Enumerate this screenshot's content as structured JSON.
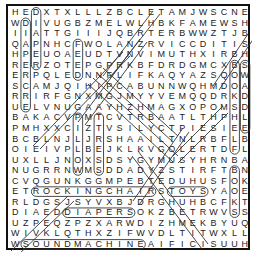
{
  "puzzle": {
    "rows": 23,
    "cols": 23,
    "grid": [
      "HEDXTXLLLZBCLETAMJWSCNE",
      "WDIVUGBZMELWLHBKFAMEWSH",
      "IIATTGIIIJQBRTERBWWZTJB",
      "QAPNHCFWOLANZRVICCDITIS",
      "HPEUOAEUDTVNVIMUTHXIRBH",
      "RERZOTEPGPRKBFDRDGMCXBS",
      "ERPQLEDNNFLIFKAQYAZSQOW",
      "SCAMJQIHIPCABUNNWQHMDOA",
      "RRIRFGNXMGJMYYVEMQQDRKD",
      "UELVNUGAAYHZHMAGXOPOMSD",
      "BAKACVPMTCVTRBAATLTHPHL",
      "PMHXXCIZTVSILYCTPIESIEE",
      "BCBLNJLJRSHAAILTNLRBFLB",
      "OIEIVPLBEJKLKVGOLERTDFL",
      "UXLLJNOXSDSYGYMUSYHRNBA",
      "NUGRRNWMSDDADYZSTIRFTBN",
      "CVQGUNKGGMPEBTEDUHUSFOK",
      "ETROCKINGCHAIRSTOYSYAOE",
      "RLDGSJSYVXBJDRGHUHBCFKT",
      "DIAEDDIAPERSOKZBETRWVSS",
      "UZPEQZPZXARWDIZHMEKBYUQ",
      "WIVKLQTHXZIFWVDLTITWXLL",
      "WSOUNDMACHINEAIFICISUUH"
    ],
    "found_words": [
      {
        "word": "ROCKINGCHAIR",
        "row": 17,
        "col": 2,
        "dir": "h",
        "len": 12
      },
      {
        "word": "TOYS",
        "row": 17,
        "col": 15,
        "dir": "h",
        "len": 4
      },
      {
        "word": "DIAPERS",
        "row": 19,
        "col": 5,
        "dir": "h",
        "len": 7
      },
      {
        "word": "SOUNDMACHINE",
        "row": 22,
        "col": 1,
        "dir": "h",
        "len": 12
      },
      {
        "word": "DIAPER",
        "row": 0,
        "col": 2,
        "dir": "v",
        "len": 6
      },
      {
        "word": "DIAPER",
        "row": 1,
        "col": 1,
        "dir": "v",
        "len": 9
      },
      {
        "word": "FEED",
        "row": 3,
        "col": 6,
        "dir": "v",
        "len": 4
      },
      {
        "word": "PILLOW",
        "row": 10,
        "col": 6,
        "dir": "v",
        "len": 6
      },
      {
        "word": "TRESS",
        "row": 10,
        "col": 8,
        "dir": "v",
        "len": 6
      },
      {
        "word": "BOOKSHELF",
        "row": 5,
        "col": 21,
        "dir": "v",
        "len": 9
      },
      {
        "word": "SWADDLE",
        "row": 5,
        "col": 22,
        "dir": "v",
        "len": 7
      },
      {
        "word": "BOOKS",
        "row": 15,
        "col": 21,
        "dir": "v",
        "len": 5
      }
    ]
  }
}
